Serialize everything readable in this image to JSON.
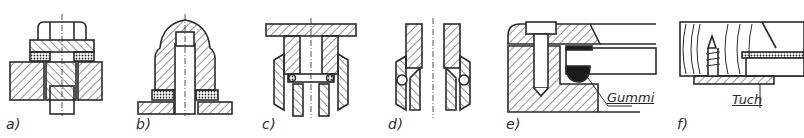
{
  "figure": {
    "panels": [
      {
        "id": "a",
        "label": "a)",
        "description": "hex bolt with gasket ring between head and plate"
      },
      {
        "id": "b",
        "label": "b)",
        "description": "domed cap nut with gasket on base plate"
      },
      {
        "id": "c",
        "label": "c)",
        "description": "pipe union with O-ring seal"
      },
      {
        "id": "d",
        "label": "d)",
        "description": "pipe union with spherical ring seal"
      },
      {
        "id": "e",
        "label": "e)",
        "description": "glass pane held by screwed frame with rubber seal",
        "annotation": "Gummi"
      },
      {
        "id": "f",
        "label": "f)",
        "description": "glass pane in wooden frame with cloth strip and wood screw",
        "annotation": "Tuch"
      }
    ]
  },
  "colors": {
    "ink": "#2a2a2a",
    "background": "#ffffff",
    "rubber": "#1a1a1a"
  }
}
